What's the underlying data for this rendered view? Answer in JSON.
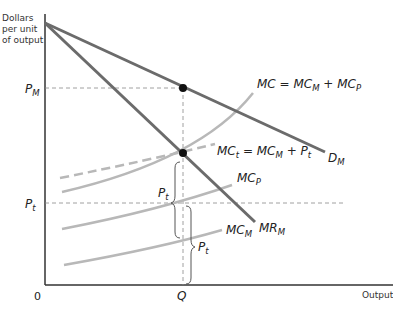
{
  "axes": {
    "y_label_lines": [
      "Dollars",
      "per unit",
      "of output"
    ],
    "x_label": "Output",
    "origin": "0"
  },
  "ticks": {
    "y": [
      {
        "main": "P",
        "sub": "M"
      },
      {
        "main": "P",
        "sub": "t"
      }
    ],
    "x": [
      {
        "main": "Q"
      }
    ]
  },
  "curves": {
    "mc_total": {
      "main": "MC = MC",
      "sub1": "M",
      "mid": " + MC",
      "sub2": "P"
    },
    "mc_tax": {
      "main": "MC",
      "sub1": "t",
      "mid": " = MC",
      "sub2": "M",
      "mid2": " + P",
      "sub3": "t"
    },
    "demand": {
      "main": "D",
      "sub": "M"
    },
    "mc_p": {
      "main": "MC",
      "sub": "P"
    },
    "mc_m": {
      "main": "MC",
      "sub": "M"
    },
    "mr": {
      "main": "MR",
      "sub": "M"
    }
  },
  "braces": [
    {
      "main": "P",
      "sub": "t"
    },
    {
      "main": "P",
      "sub": "t"
    }
  ],
  "colors": {
    "dark_line": "#6b6b6b",
    "light_line": "#b8b8b8",
    "axis": "#333333",
    "dot": "#111111"
  }
}
